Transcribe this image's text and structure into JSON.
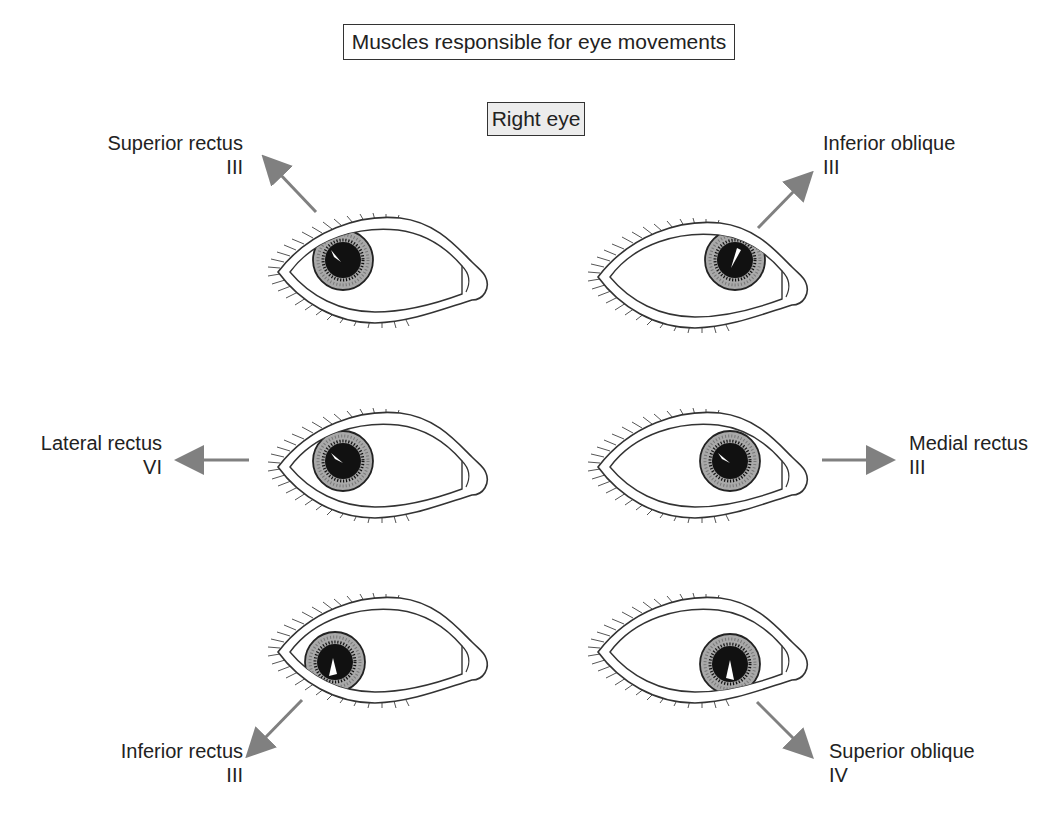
{
  "title": "Muscles responsible for eye movements",
  "subtitle": "Right eye",
  "colors": {
    "arrow": "#808080",
    "iris": "#a9a9a9",
    "pupil": "#111111",
    "outline": "#333333",
    "subtitle_fill": "#ececec"
  },
  "muscles": [
    {
      "name": "Superior rectus",
      "nerve": "III",
      "direction": "up-left",
      "position": "top-left"
    },
    {
      "name": "Inferior oblique",
      "nerve": "III",
      "direction": "up-right",
      "position": "top-right"
    },
    {
      "name": "Lateral rectus",
      "nerve": "VI",
      "direction": "left",
      "position": "middle-left"
    },
    {
      "name": "Medial rectus",
      "nerve": "III",
      "direction": "right",
      "position": "middle-right"
    },
    {
      "name": "Inferior rectus",
      "nerve": "III",
      "direction": "down-left",
      "position": "bottom-left"
    },
    {
      "name": "Superior oblique",
      "nerve": "IV",
      "direction": "down-right",
      "position": "bottom-right"
    }
  ]
}
